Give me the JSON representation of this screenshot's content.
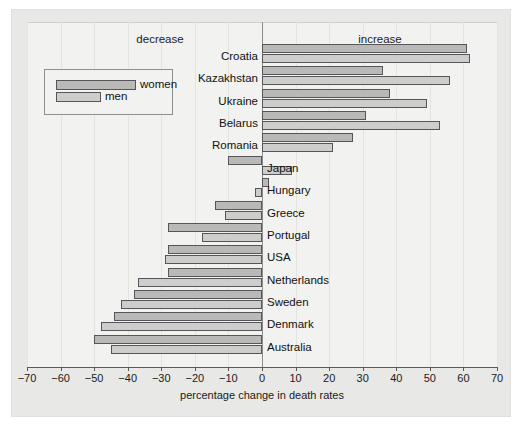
{
  "figure": {
    "background_color": "#e8e8e6",
    "panel_color": "#f2f2f0",
    "women_color": "#b9b9b7",
    "men_color": "#cdcdcb"
  },
  "annotations": {
    "decrease": "decrease",
    "increase": "increase"
  },
  "legend": {
    "women_label": "women",
    "men_label": "men"
  },
  "chart_data": {
    "type": "bar",
    "orientation": "horizontal",
    "title": "",
    "xlabel": "percentage change in death rates",
    "ylabel": "",
    "xlim": [
      -70,
      70
    ],
    "xticks": [
      -70,
      -60,
      -50,
      -40,
      -30,
      -20,
      -10,
      0,
      10,
      20,
      30,
      40,
      50,
      60,
      70
    ],
    "xticklabels": [
      "−70",
      "−60",
      "−50",
      "−40",
      "−30",
      "−20",
      "−10",
      "0",
      "10",
      "20",
      "30",
      "40",
      "50",
      "60",
      "70"
    ],
    "grid": true,
    "legend_position": "upper left",
    "annotations": [
      "decrease",
      "increase"
    ],
    "categories": [
      "Croatia",
      "Kazakhstan",
      "Ukraine",
      "Belarus",
      "Romania",
      "Japan",
      "Hungary",
      "Greece",
      "Portugal",
      "USA",
      "Netherlands",
      "Sweden",
      "Denmark",
      "Australia"
    ],
    "series": [
      {
        "name": "women",
        "color": "#b9b9b7",
        "values": [
          61,
          36,
          38,
          31,
          27,
          -10,
          2,
          -14,
          -28,
          -28,
          -28,
          -38,
          -44,
          -50
        ]
      },
      {
        "name": "men",
        "color": "#cdcdcb",
        "values": [
          62,
          56,
          49,
          53,
          21,
          9,
          -2,
          -11,
          -18,
          -29,
          -37,
          -42,
          -48,
          -45
        ]
      }
    ]
  }
}
